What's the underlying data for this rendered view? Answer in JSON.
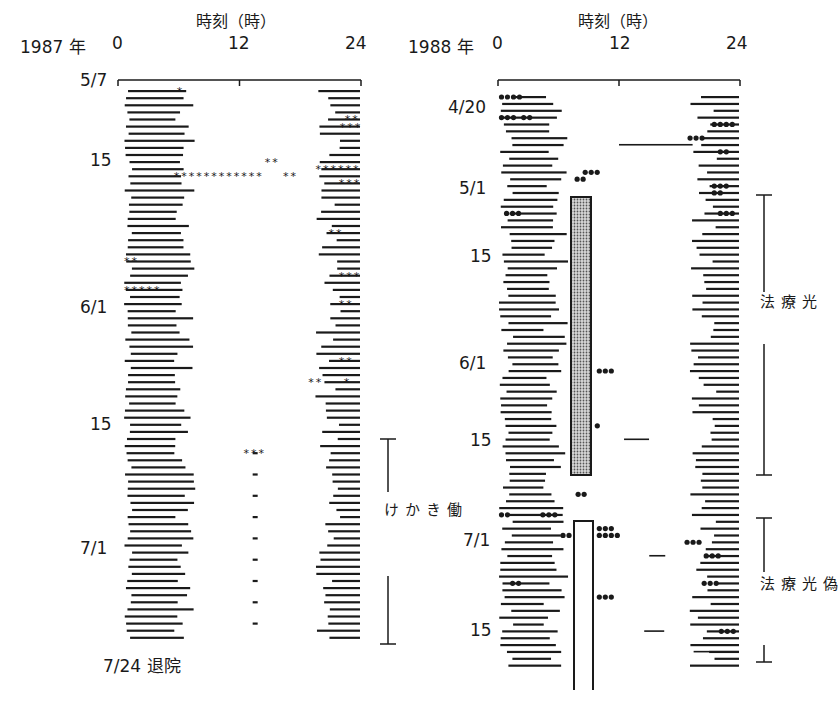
{
  "chart_data": [
    {
      "type": "actogram",
      "panel": "left",
      "year_label": "1987 年",
      "axis_title": "時刻（時）",
      "x_ticks": [
        "0",
        "12",
        "24"
      ],
      "xlim": [
        0,
        24
      ],
      "date_labels": [
        {
          "text": "5/7",
          "day": 0
        },
        {
          "text": "15",
          "day": 8
        },
        {
          "text": "6/1",
          "day": 25
        },
        {
          "text": "15",
          "day": 39
        },
        {
          "text": "7/1",
          "day": 55
        }
      ],
      "end_label": "7/24 退院",
      "bracket": {
        "label": "働きかけ",
        "start_day": 40,
        "end_day": 78
      },
      "marker": "*",
      "row_count": 78,
      "notes": "Each row = one day; horizontal bars = sleep episodes; * = naps/irregular sleep"
    },
    {
      "type": "actogram",
      "panel": "right",
      "year_label": "1988 年",
      "axis_title": "時刻（時）",
      "x_ticks": [
        "0",
        "12",
        "24"
      ],
      "xlim": [
        0,
        24
      ],
      "date_labels": [
        {
          "text": "4/20",
          "day": 2
        },
        {
          "text": "5/1",
          "day": 13
        },
        {
          "text": "15",
          "day": 23
        },
        {
          "text": "6/1",
          "day": 38
        },
        {
          "text": "15",
          "day": 49
        },
        {
          "text": "7/1",
          "day": 63
        },
        {
          "text": "15",
          "day": 76
        }
      ],
      "brackets": [
        {
          "label": "光療法",
          "start_day": 16,
          "end_day": 56,
          "shaded_box_hours": [
            7,
            9
          ]
        },
        {
          "label": "偽光療法",
          "start_day": 60,
          "end_day": 84,
          "open_box_hours": [
            7.5,
            9
          ]
        }
      ],
      "marker": "●",
      "row_count": 84
    }
  ],
  "left": {
    "year": "1987 年",
    "axis_title": "時刻（時）",
    "tick0": "0",
    "tick12": "12",
    "tick24": "24",
    "dates": [
      "5/7",
      "15",
      "6/1",
      "15",
      "7/1"
    ],
    "end_label": "7/24 退院",
    "bracket_label": "働きかけ"
  },
  "right": {
    "year": "1988 年",
    "axis_title": "時刻（時）",
    "tick0": "0",
    "tick12": "12",
    "tick24": "24",
    "dates": [
      "4/20",
      "5/1",
      "15",
      "6/1",
      "15",
      "7/1",
      "15"
    ],
    "bracket1_label": "光療法",
    "bracket2_label": "偽光療法"
  },
  "style": {
    "ink": "#1a1a1a",
    "shade": "#9a9a9a"
  }
}
